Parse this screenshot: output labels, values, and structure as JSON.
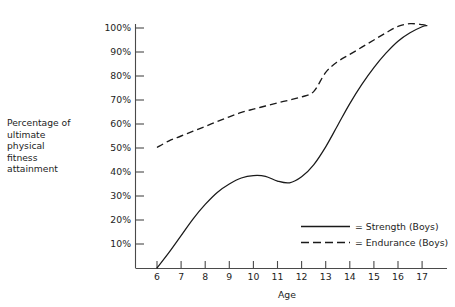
{
  "chart_data": {
    "type": "line",
    "title": "",
    "xlabel": "Age",
    "ylabel": "Percentage of ultimate physical fitness attainment",
    "ylabel_lines": [
      "Percentage of",
      "ultimate",
      "physical",
      "fitness",
      "attainment"
    ],
    "xlim": [
      5.5,
      17.7
    ],
    "ylim": [
      0,
      105
    ],
    "grid": false,
    "legend_position": "bottom-right",
    "x_ticks": [
      6,
      7,
      8,
      9,
      10,
      11,
      12,
      13,
      14,
      15,
      16,
      17
    ],
    "x_tick_labels": [
      "6",
      "7",
      "8",
      "9",
      "10",
      "11",
      "12",
      "13",
      "14",
      "15",
      "16",
      "17"
    ],
    "y_ticks": [
      10,
      20,
      30,
      40,
      50,
      60,
      70,
      80,
      90,
      100
    ],
    "y_tick_labels": [
      "10%",
      "20%",
      "30%",
      "40%",
      "50%",
      "60%",
      "70%",
      "80%",
      "90%",
      "100%"
    ],
    "x": [
      6,
      6.5,
      7,
      7.5,
      8,
      8.5,
      9,
      9.5,
      10,
      10.5,
      11,
      11.5,
      12,
      12.5,
      13,
      13.5,
      14,
      14.5,
      15,
      15.5,
      16,
      16.5,
      17,
      17.2
    ],
    "series": [
      {
        "name": "Strength (Boys)",
        "legend_label": "= Strength (Boys)",
        "style": "solid",
        "color": "#1a1a1a",
        "values": [
          0,
          6.5,
          13.5,
          20.5,
          26.5,
          31.5,
          35,
          37.5,
          38.5,
          38.2,
          36.2,
          35.5,
          38,
          43,
          50.5,
          59.5,
          68.5,
          76.5,
          83.5,
          89.5,
          94.5,
          98,
          100.5,
          101
        ]
      },
      {
        "name": "Endurance (Boys)",
        "legend_label": "= Endurance (Boys)",
        "style": "dashed",
        "color": "#1a1a1a",
        "values": [
          50.2,
          53,
          55,
          57,
          59,
          61,
          63,
          64.8,
          66.2,
          67.5,
          68.8,
          70,
          71.3,
          73.5,
          81.5,
          86,
          89,
          92,
          95,
          98,
          100.7,
          101.8,
          101.4,
          101
        ]
      }
    ]
  },
  "legend": {
    "entries": [
      {
        "label": "= Strength (Boys)",
        "style": "solid"
      },
      {
        "label": "= Endurance (Boys)",
        "style": "dashed"
      }
    ]
  },
  "axes": {
    "x_title": "Age"
  }
}
